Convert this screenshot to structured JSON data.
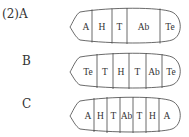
{
  "question_label": "(2)",
  "options": [
    {
      "letter": "A",
      "segments": [
        "A",
        "H",
        "T",
        "Ab",
        "Te"
      ]
    },
    {
      "letter": "B",
      "segments": [
        "Te",
        "T",
        "H",
        "T",
        "Ab",
        "Te"
      ]
    },
    {
      "letter": "C",
      "segments": [
        "A",
        "H",
        "T",
        "Ab",
        "T",
        "H",
        "A"
      ]
    }
  ],
  "colors": {
    "stroke": "#444444",
    "text": "#333333"
  }
}
